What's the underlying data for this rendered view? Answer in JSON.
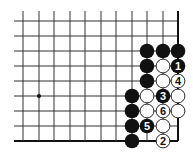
{
  "diagram": {
    "type": "go-problem",
    "grid": {
      "columns_x": [
        23,
        39,
        54,
        70,
        85,
        101,
        116,
        132,
        147,
        163,
        178
      ],
      "rows_y": [
        21,
        36,
        51,
        66,
        81,
        96,
        111,
        126,
        141
      ],
      "open_left_x": 14,
      "open_top_y": 11,
      "edges": [
        "right",
        "bottom"
      ],
      "line_color": "#333333",
      "edge_color": "#111111"
    },
    "star_points": [
      {
        "col": 1,
        "row": 5
      }
    ],
    "stones": [
      {
        "col": 8,
        "row": 2,
        "color": "black",
        "label": ""
      },
      {
        "col": 9,
        "row": 2,
        "color": "black",
        "label": ""
      },
      {
        "col": 10,
        "row": 2,
        "color": "black",
        "label": ""
      },
      {
        "col": 8,
        "row": 3,
        "color": "black",
        "label": ""
      },
      {
        "col": 9,
        "row": 3,
        "color": "white",
        "label": ""
      },
      {
        "col": 10,
        "row": 3,
        "color": "black",
        "label": "1"
      },
      {
        "col": 8,
        "row": 4,
        "color": "black",
        "label": ""
      },
      {
        "col": 9,
        "row": 4,
        "color": "white",
        "label": ""
      },
      {
        "col": 10,
        "row": 4,
        "color": "white",
        "label": "4"
      },
      {
        "col": 7,
        "row": 5,
        "color": "black",
        "label": ""
      },
      {
        "col": 8,
        "row": 5,
        "color": "white",
        "label": ""
      },
      {
        "col": 9,
        "row": 5,
        "color": "black",
        "label": "3"
      },
      {
        "col": 10,
        "row": 5,
        "color": "white",
        "label": ""
      },
      {
        "col": 7,
        "row": 6,
        "color": "black",
        "label": ""
      },
      {
        "col": 8,
        "row": 6,
        "color": "white",
        "label": ""
      },
      {
        "col": 9,
        "row": 6,
        "color": "white",
        "label": "6"
      },
      {
        "col": 10,
        "row": 6,
        "color": "white",
        "label": ""
      },
      {
        "col": 7,
        "row": 7,
        "color": "black",
        "label": ""
      },
      {
        "col": 8,
        "row": 7,
        "color": "black",
        "label": "5"
      },
      {
        "col": 9,
        "row": 7,
        "color": "white",
        "label": ""
      },
      {
        "col": 7,
        "row": 8,
        "color": "black",
        "label": ""
      },
      {
        "col": 9,
        "row": 8,
        "color": "white",
        "label": "2"
      }
    ],
    "stone_radius": 7.3,
    "colors": {
      "black_stone": "#111111",
      "white_stone": "#ffffff",
      "white_stroke": "#111111",
      "label_on_black": "#ffffff",
      "label_on_white": "#111111"
    }
  }
}
